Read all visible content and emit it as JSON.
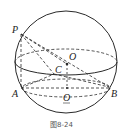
{
  "figure": {
    "type": "sphere-geometry",
    "caption": "图8-24",
    "points": {
      "P": "P",
      "O": "O",
      "C": "C",
      "A": "A",
      "B": "B",
      "O1": "O"
    },
    "colors": {
      "stroke": "#2a2a2a",
      "background": "#ffffff"
    }
  }
}
